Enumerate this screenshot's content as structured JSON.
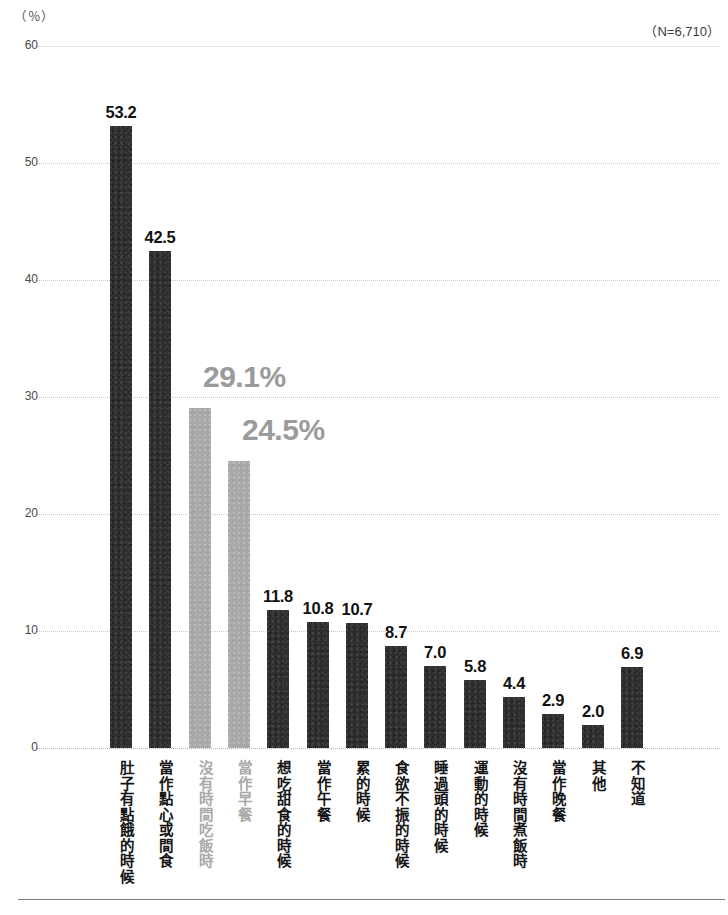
{
  "header": {
    "unit_label": "（％）",
    "n_label": "（N=6,710）"
  },
  "chart_data": {
    "type": "bar",
    "title": "",
    "subtitle": "",
    "xlabel": "",
    "ylabel": "（％）",
    "ylim": [
      0,
      60
    ],
    "yticks": [
      "0",
      "10",
      "20",
      "30",
      "40",
      "50",
      "60"
    ],
    "grid": true,
    "legend": "none",
    "sample_size": "（N=6,710）",
    "categories": [
      "肚子有點餓的時候",
      "當作點心或間食",
      "沒有時間吃飯時",
      "當作早餐",
      "想吃甜食的時候",
      "當作午餐",
      "累的時候",
      "食欲不振的時候",
      "睡過頭的時候",
      "運動的時候",
      "沒有時間煮飯時",
      "當作晚餐",
      "其他",
      "不知道"
    ],
    "values": [
      53.2,
      42.5,
      29.1,
      24.5,
      11.8,
      10.8,
      10.7,
      8.7,
      7.0,
      5.8,
      4.4,
      2.9,
      2.0,
      6.9
    ],
    "value_labels": [
      "53.2",
      "42.5",
      "29.1%",
      "24.5%",
      "11.8",
      "10.8",
      "10.7",
      "8.7",
      "7.0",
      "5.8",
      "4.4",
      "2.9",
      "2.0",
      "6.9"
    ],
    "highlighted": [
      false,
      false,
      true,
      true,
      false,
      false,
      false,
      false,
      false,
      false,
      false,
      false,
      false,
      false
    ],
    "colors": {
      "bar_default": "#2e2e2e",
      "bar_highlight": "#a9a9a9",
      "label_default": "#111111",
      "label_highlight": "#9b9b9b",
      "gridline": "#c9c9c9"
    }
  }
}
